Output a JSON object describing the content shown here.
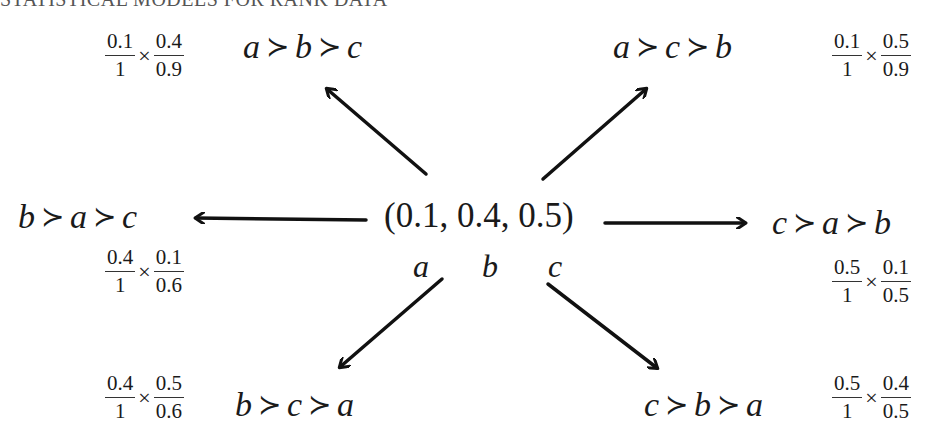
{
  "header": {
    "text": "STATISTICAL MODELS FOR RANK DATA"
  },
  "center": {
    "tuple": "(0.1, 0.4, 0.5)",
    "labels": [
      "a",
      "b",
      "c"
    ]
  },
  "rankings": [
    {
      "id": "abc",
      "items": [
        "a",
        "b",
        "c"
      ],
      "sep": "≻",
      "prob": {
        "f1": {
          "num": "0.1",
          "den": "1"
        },
        "times": "×",
        "f2": {
          "num": "0.4",
          "den": "0.9"
        }
      }
    },
    {
      "id": "acb",
      "items": [
        "a",
        "c",
        "b"
      ],
      "sep": "≻",
      "prob": {
        "f1": {
          "num": "0.1",
          "den": "1"
        },
        "times": "×",
        "f2": {
          "num": "0.5",
          "den": "0.9"
        }
      }
    },
    {
      "id": "bac",
      "items": [
        "b",
        "a",
        "c"
      ],
      "sep": "≻",
      "prob": {
        "f1": {
          "num": "0.4",
          "den": "1"
        },
        "times": "×",
        "f2": {
          "num": "0.1",
          "den": "0.6"
        }
      }
    },
    {
      "id": "cab",
      "items": [
        "c",
        "a",
        "b"
      ],
      "sep": "≻",
      "prob": {
        "f1": {
          "num": "0.5",
          "den": "1"
        },
        "times": "×",
        "f2": {
          "num": "0.1",
          "den": "0.5"
        }
      }
    },
    {
      "id": "bca",
      "items": [
        "b",
        "c",
        "a"
      ],
      "sep": "≻",
      "prob": {
        "f1": {
          "num": "0.4",
          "den": "1"
        },
        "times": "×",
        "f2": {
          "num": "0.5",
          "den": "0.6"
        }
      }
    },
    {
      "id": "cba",
      "items": [
        "c",
        "b",
        "a"
      ],
      "sep": "≻",
      "prob": {
        "f1": {
          "num": "0.5",
          "den": "1"
        },
        "times": "×",
        "f2": {
          "num": "0.4",
          "den": "0.5"
        }
      }
    }
  ],
  "colors": {
    "ink": "#1a1a1a",
    "background": "#ffffff"
  }
}
